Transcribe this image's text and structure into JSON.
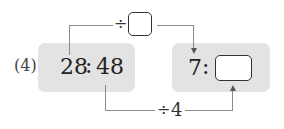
{
  "problem": {
    "number_label": "(4)",
    "left_ratio": {
      "first": "28",
      "separator": ":",
      "second": "48"
    },
    "right_ratio": {
      "first": "7",
      "separator": ":",
      "second_blank": ""
    },
    "top_operation": {
      "symbol": "÷",
      "blank": ""
    },
    "bottom_operation": {
      "symbol": "÷",
      "value": "4"
    }
  },
  "colors": {
    "box_fill": "#e3e3e3",
    "connector": "#8a8a8a",
    "text": "#222222"
  }
}
